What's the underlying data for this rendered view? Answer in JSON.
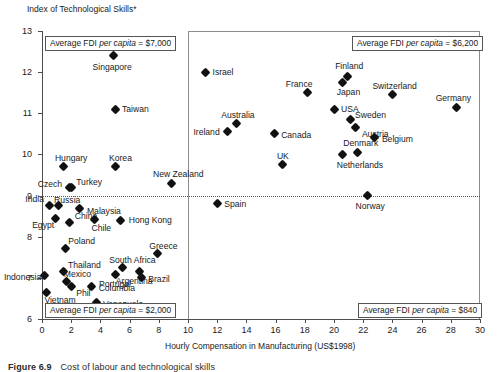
{
  "figure": {
    "caption_number": "Figure 6.9",
    "caption_text": "Cost of labour and technological skills",
    "ylabel": "Index of Technological Skills*",
    "xlabel": "Hourly Compensation in Manufacturing (US$1998)"
  },
  "annotations": [
    {
      "name": "annot-top-left",
      "text": "Average FDI per capita = $7,000"
    },
    {
      "name": "annot-top-right",
      "text": "Average FDI per capita = $6,200"
    },
    {
      "name": "annot-bottom-left",
      "text": "Average FDI per capita = $2,000"
    },
    {
      "name": "annot-bottom-right",
      "text": "Average FDI per capita = $840"
    }
  ],
  "annotation_parts": {
    "a1_pre": "Average FDI ",
    "a1_it": "per capita",
    "a1_post": " = $7,000",
    "a2_pre": "Average FDI ",
    "a2_it": "per capita",
    "a2_post": " = $6,200",
    "a3_pre": "Average FDI ",
    "a3_it": "per capita",
    "a3_post": " = $2,000",
    "a4_pre": "Average FDI ",
    "a4_it": "per capita",
    "a4_post": " = $840"
  },
  "chart_data": {
    "type": "scatter",
    "title": "",
    "xlabel": "Hourly Compensation in Manufacturing (US$1998)",
    "ylabel": "Index of Technological Skills*",
    "xlim": [
      0,
      30
    ],
    "ylim": [
      6,
      13
    ],
    "xticks": [
      0,
      2,
      4,
      6,
      8,
      10,
      12,
      14,
      16,
      18,
      20,
      22,
      24,
      26,
      28,
      30
    ],
    "yticks": [
      6,
      7,
      8,
      9,
      10,
      11,
      12,
      13
    ],
    "grid": false,
    "legend": "none",
    "quadrant_divider_x": 10,
    "quadrant_divider_y": 9,
    "points": [
      {
        "label": "Singapore",
        "x": 4.9,
        "y": 12.4,
        "lx": -21,
        "ly": 7
      },
      {
        "label": "Israel",
        "x": 11.2,
        "y": 12.0,
        "lx": 7,
        "ly": -4
      },
      {
        "label": "Finland",
        "x": 20.9,
        "y": 11.9,
        "lx": -12,
        "ly": -14
      },
      {
        "label": "Japan",
        "x": 20.6,
        "y": 11.75,
        "lx": -6,
        "ly": 6
      },
      {
        "label": "Switzerland",
        "x": 24.0,
        "y": 11.45,
        "lx": -20,
        "ly": -13
      },
      {
        "label": "Germany",
        "x": 28.4,
        "y": 11.15,
        "lx": -21,
        "ly": -13
      },
      {
        "label": "France",
        "x": 18.2,
        "y": 11.5,
        "lx": -22,
        "ly": -13
      },
      {
        "label": "Taiwan",
        "x": 5.0,
        "y": 11.1,
        "lx": 7,
        "ly": -4
      },
      {
        "label": "USA",
        "x": 20.0,
        "y": 11.1,
        "lx": 7,
        "ly": -4
      },
      {
        "label": "Sweden",
        "x": 21.1,
        "y": 10.85,
        "lx": 5,
        "ly": -8
      },
      {
        "label": "Austria",
        "x": 21.5,
        "y": 10.65,
        "lx": 6,
        "ly": 2
      },
      {
        "label": "Australia",
        "x": 13.3,
        "y": 10.75,
        "lx": -15,
        "ly": -13
      },
      {
        "label": "Belgium",
        "x": 22.8,
        "y": 10.4,
        "lx": 7,
        "ly": -3
      },
      {
        "label": "Ireland",
        "x": 12.7,
        "y": 10.55,
        "lx": -34,
        "ly": -4
      },
      {
        "label": "Canada",
        "x": 15.9,
        "y": 10.5,
        "lx": 7,
        "ly": -3
      },
      {
        "label": "Denmark",
        "x": 21.6,
        "y": 10.05,
        "lx": -14,
        "ly": -13
      },
      {
        "label": "Netherlands",
        "x": 20.6,
        "y": 10.0,
        "lx": -6,
        "ly": 7
      },
      {
        "label": "Hungary",
        "x": 1.5,
        "y": 9.7,
        "lx": -9,
        "ly": -13
      },
      {
        "label": "Korea",
        "x": 5.0,
        "y": 9.7,
        "lx": -6,
        "ly": -13
      },
      {
        "label": "UK",
        "x": 16.5,
        "y": 9.75,
        "lx": -6,
        "ly": -13
      },
      {
        "label": "New Zealand",
        "x": 8.9,
        "y": 9.3,
        "lx": -19,
        "ly": -13
      },
      {
        "label": "Czech",
        "x": 1.9,
        "y": 9.2,
        "lx": -32,
        "ly": -7
      },
      {
        "label": "Turkey",
        "x": 2.0,
        "y": 9.2,
        "lx": 5,
        "ly": -9
      },
      {
        "label": "Norway",
        "x": 22.3,
        "y": 9.0,
        "lx": -12,
        "ly": 6
      },
      {
        "label": "India",
        "x": 0.5,
        "y": 8.75,
        "lx": -24,
        "ly": -11
      },
      {
        "label": "Russia",
        "x": 1.1,
        "y": 8.75,
        "lx": -4,
        "ly": -10
      },
      {
        "label": "Spain",
        "x": 12.0,
        "y": 8.8,
        "lx": 7,
        "ly": -4
      },
      {
        "label": "Malaysia",
        "x": 2.6,
        "y": 8.68,
        "lx": 7,
        "ly": -2
      },
      {
        "label": "Egypt",
        "x": 0.9,
        "y": 8.45,
        "lx": -23,
        "ly": 3
      },
      {
        "label": "China",
        "x": 1.9,
        "y": 8.35,
        "lx": 5,
        "ly": -10
      },
      {
        "label": "Chile",
        "x": 3.6,
        "y": 8.42,
        "lx": -3,
        "ly": 5
      },
      {
        "label": "Hong Kong",
        "x": 5.4,
        "y": 8.4,
        "lx": 8,
        "ly": -4
      },
      {
        "label": "Poland",
        "x": 1.6,
        "y": 7.72,
        "lx": 3,
        "ly": -11
      },
      {
        "label": "Greece",
        "x": 7.9,
        "y": 7.58,
        "lx": -8,
        "ly": -12
      },
      {
        "label": "South Africa",
        "x": 5.5,
        "y": 7.25,
        "lx": -13,
        "ly": -12
      },
      {
        "label": "Thailand",
        "x": 1.5,
        "y": 7.15,
        "lx": 4,
        "ly": -11
      },
      {
        "label": "Argentina",
        "x": 6.7,
        "y": 7.15,
        "lx": -24,
        "ly": 5
      },
      {
        "label": "Indonesia",
        "x": 0.2,
        "y": 7.05,
        "lx": -41,
        "ly": -3
      },
      {
        "label": "Portugal",
        "x": 5.0,
        "y": 7.08,
        "lx": -16,
        "ly": 5
      },
      {
        "label": "Brazil",
        "x": 6.8,
        "y": 7.0,
        "lx": 7,
        "ly": -3
      },
      {
        "label": "Mexico",
        "x": 1.7,
        "y": 6.92,
        "lx": -3,
        "ly": -11
      },
      {
        "label": "Phil",
        "x": 2.0,
        "y": 6.78,
        "lx": 5,
        "ly": 2
      },
      {
        "label": "Columbia",
        "x": 3.4,
        "y": 6.78,
        "lx": 7,
        "ly": -3
      },
      {
        "label": "Vietnam",
        "x": 0.3,
        "y": 6.65,
        "lx": -2,
        "ly": 4
      },
      {
        "label": "Venezuela",
        "x": 3.7,
        "y": 6.4,
        "lx": 7,
        "ly": -3
      }
    ]
  }
}
